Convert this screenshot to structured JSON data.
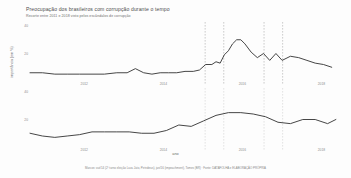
{
  "header": {
    "title": "Preocupação dos brasileiros com corrupção durante o tempo",
    "subtitle": "Recorte entre 2011 e 2018 visto pelos escândalos de corrupção"
  },
  "axes": {
    "xlabel": "ano",
    "ylabel": "importância (em %)",
    "xticks": [
      "2012",
      "2014",
      "2016",
      "2018"
    ],
    "xtick_positions": [
      0.175,
      0.43,
      0.685,
      0.94
    ]
  },
  "footer": {
    "note": "Marcos: out/14 (2º turno eleição Lava Jato, Petrobras), jan/16 (impeachment), Tomes (BR) · Fonte: DATAFOLHA e ELABORAÇÃO PRÓPRIA"
  },
  "chart_data": {
    "type": "line",
    "title": "Preocupação dos brasileiros com corrupção durante o tempo",
    "xlabel": "ano",
    "ylabel": "importância (em %)",
    "x_range": [
      2011,
      2018.5
    ],
    "grid": false,
    "legend": "none",
    "line_color": "#3c3c3c",
    "event_marker_color_top": "#9a9a9a",
    "event_marker_color_bottom": "#c9c9c9",
    "panels": [
      {
        "name": "corrupcao",
        "ylim": [
          0,
          40
        ],
        "yticks": [
          20,
          40
        ],
        "events_x": [
          0.565,
          0.625,
          0.755,
          0.815
        ],
        "series": [
          {
            "name": "Corrupção",
            "x": [
              2011.0,
              2011.3,
              2011.6,
              2011.9,
              2012.2,
              2012.5,
              2012.8,
              2013.1,
              2013.35,
              2013.55,
              2013.75,
              2013.95,
              2014.15,
              2014.35,
              2014.55,
              2014.75,
              2014.95,
              2015.1,
              2015.25,
              2015.4,
              2015.5,
              2015.6,
              2015.7,
              2015.8,
              2015.9,
              2016.0,
              2016.1,
              2016.2,
              2016.35,
              2016.5,
              2016.65,
              2016.8,
              2016.95,
              2017.1,
              2017.3,
              2017.5,
              2017.7,
              2017.9,
              2018.1,
              2018.3
            ],
            "y": [
              6,
              6,
              5,
              5,
              5,
              5,
              5,
              6,
              6,
              9,
              6,
              5,
              6,
              6,
              6,
              7,
              7,
              8,
              12,
              12,
              14,
              13,
              19,
              22,
              27,
              30,
              30,
              27,
              21,
              17,
              20,
              15,
              20,
              15,
              18,
              17,
              15,
              13,
              12,
              10
            ]
          }
        ]
      },
      {
        "name": "outros-temas",
        "ylim": [
          0,
          40
        ],
        "yticks": [
          20,
          40
        ],
        "events_x": [
          0.565,
          0.625,
          0.755,
          0.815
        ],
        "series": [
          {
            "name": "Outros temas",
            "x": [
              2011.0,
              2011.3,
              2011.6,
              2011.9,
              2012.2,
              2012.5,
              2012.8,
              2013.1,
              2013.4,
              2013.7,
              2014.0,
              2014.3,
              2014.6,
              2014.9,
              2015.2,
              2015.5,
              2015.8,
              2016.1,
              2016.4,
              2016.7,
              2017.0,
              2017.3,
              2017.6,
              2017.9,
              2018.2,
              2018.4
            ],
            "y": [
              10,
              8,
              7,
              8,
              9,
              11,
              11,
              11,
              11,
              10,
              10,
              12,
              16,
              15,
              19,
              23,
              25,
              25,
              24,
              22,
              18,
              17,
              20,
              20,
              17,
              20
            ]
          }
        ]
      }
    ]
  }
}
